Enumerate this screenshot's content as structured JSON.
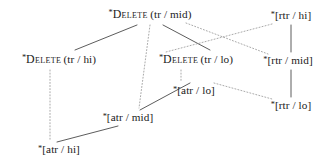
{
  "figure": {
    "name": "constraint-ranking-lattice",
    "type": "hasse-diagram",
    "width": 329,
    "height": 168,
    "background_color": "#ffffff",
    "solid_edge_color": "#4a4a4a",
    "dotted_edge_color": "#9a9a9a",
    "text_color": "#1a1a1a"
  },
  "nodes": [
    {
      "id": "delete-tr-mid",
      "star": "*",
      "name_smallcaps": "Delete",
      "args": "(tr / mid)",
      "full_label": "*Delete (tr / mid)",
      "kind": "delete",
      "x": 150,
      "y": 15
    },
    {
      "id": "delete-tr-hi",
      "star": "*",
      "name_smallcaps": "Delete",
      "args": "(tr / hi)",
      "full_label": "*Delete (tr / hi)",
      "kind": "delete",
      "x": 59,
      "y": 60
    },
    {
      "id": "delete-tr-lo",
      "star": "*",
      "name_smallcaps": "Delete",
      "args": "(tr / lo)",
      "full_label": "*Delete (tr / lo)",
      "kind": "delete",
      "x": 196,
      "y": 60
    },
    {
      "id": "rtr-hi",
      "star": "*",
      "name_smallcaps": "",
      "args": "[rtr / hi]",
      "full_label": "*[rtr / hi]",
      "kind": "bracket",
      "x": 291,
      "y": 16
    },
    {
      "id": "rtr-mid",
      "star": "*",
      "name_smallcaps": "",
      "args": "[rtr / mid]",
      "full_label": "*[rtr / mid]",
      "kind": "bracket",
      "x": 288,
      "y": 61
    },
    {
      "id": "rtr-lo",
      "star": "*",
      "name_smallcaps": "",
      "args": "[rtr / lo]",
      "full_label": "*[rtr / lo]",
      "kind": "bracket",
      "x": 291,
      "y": 106
    },
    {
      "id": "atr-lo",
      "star": "*",
      "name_smallcaps": "",
      "args": "[atr / lo]",
      "full_label": "*[atr / lo]",
      "kind": "bracket",
      "x": 194,
      "y": 91
    },
    {
      "id": "atr-mid",
      "star": "*",
      "name_smallcaps": "",
      "args": "[atr / mid]",
      "full_label": "*[atr / mid]",
      "kind": "bracket",
      "x": 128,
      "y": 118
    },
    {
      "id": "atr-hi",
      "star": "*",
      "name_smallcaps": "",
      "args": "[atr / hi]",
      "full_label": "*[atr / hi]",
      "kind": "bracket",
      "x": 59,
      "y": 150
    }
  ],
  "edges": [
    {
      "id": "e-mid-hi",
      "from": "delete-tr-mid",
      "to": "delete-tr-hi",
      "style": "solid",
      "x1": 137,
      "y1": 25,
      "x2": 75,
      "y2": 50
    },
    {
      "id": "e-mid-lo",
      "from": "delete-tr-mid",
      "to": "delete-tr-lo",
      "style": "solid",
      "x1": 163,
      "y1": 25,
      "x2": 210,
      "y2": 50
    },
    {
      "id": "e-mid-atrmid",
      "from": "delete-tr-mid",
      "to": "atr-mid",
      "style": "dotted",
      "x1": 150,
      "y1": 25,
      "x2": 139,
      "y2": 108
    },
    {
      "id": "e-mid-rtrmid",
      "from": "delete-tr-mid",
      "to": "rtr-mid",
      "style": "dotted",
      "x1": 186,
      "y1": 23,
      "x2": 268,
      "y2": 54
    },
    {
      "id": "e-rtrhi-trlo",
      "from": "rtr-hi",
      "to": "delete-tr-lo",
      "style": "dotted",
      "x1": 272,
      "y1": 24,
      "x2": 166,
      "y2": 52
    },
    {
      "id": "e-trhi-atrhi",
      "from": "delete-tr-hi",
      "to": "atr-hi",
      "style": "dotted",
      "x1": 50,
      "y1": 70,
      "x2": 50,
      "y2": 141
    },
    {
      "id": "e-trlo-atrlo",
      "from": "delete-tr-lo",
      "to": "atr-lo",
      "style": "dotted",
      "x1": 181,
      "y1": 70,
      "x2": 181,
      "y2": 82
    },
    {
      "id": "e-atrlo-rtrlo",
      "from": "atr-lo",
      "to": "rtr-lo",
      "style": "dotted",
      "x1": 214,
      "y1": 83,
      "x2": 272,
      "y2": 99
    },
    {
      "id": "e-atrhi-atrmid",
      "from": "atr-hi",
      "to": "atr-mid",
      "style": "solid",
      "x1": 57,
      "y1": 142,
      "x2": 118,
      "y2": 126
    },
    {
      "id": "e-atrmid-atrlo",
      "from": "atr-mid",
      "to": "atr-lo",
      "style": "solid",
      "x1": 140,
      "y1": 110,
      "x2": 190,
      "y2": 83
    },
    {
      "id": "e-rtrhi-rtrmid",
      "from": "rtr-hi",
      "to": "rtr-mid",
      "style": "solid",
      "x1": 291,
      "y1": 25,
      "x2": 291,
      "y2": 52
    },
    {
      "id": "e-rtrmid-rtrlo",
      "from": "rtr-mid",
      "to": "rtr-lo",
      "style": "solid",
      "x1": 291,
      "y1": 70,
      "x2": 291,
      "y2": 97
    }
  ]
}
